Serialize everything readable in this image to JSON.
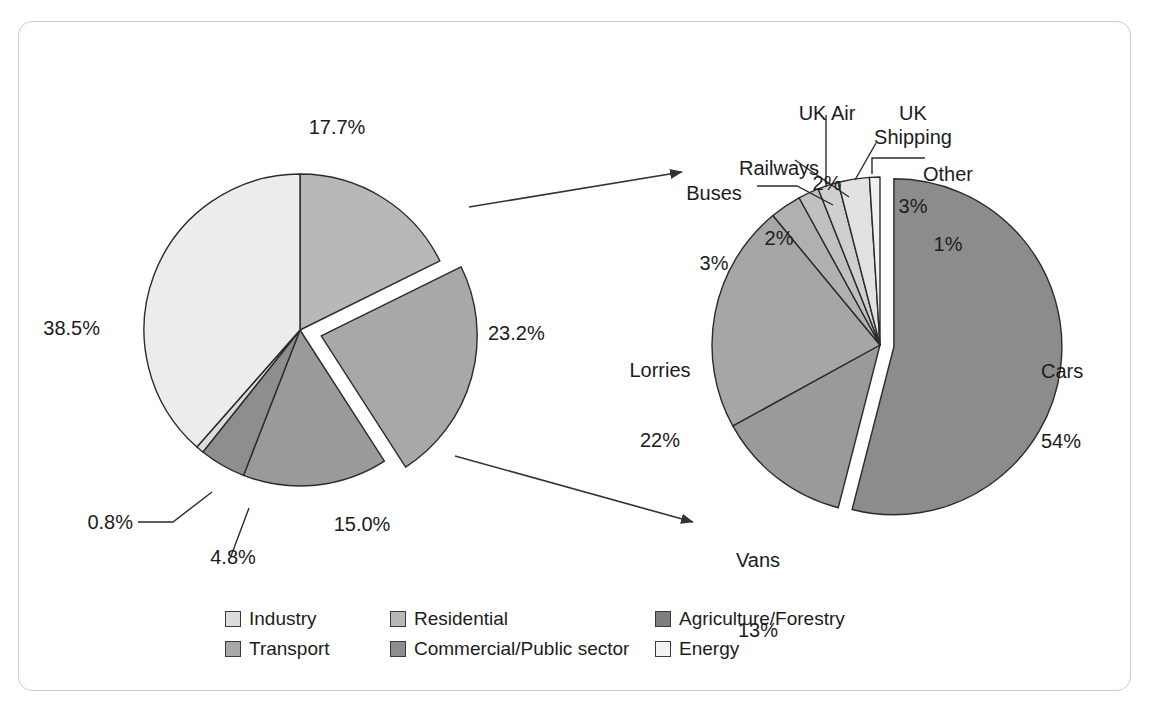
{
  "figure": {
    "width": 1153,
    "height": 713,
    "background": "#ffffff",
    "frame_color": "#cdcdcd"
  },
  "chart_data": [
    {
      "type": "pie",
      "name": "uk-co2-emissions-by-sector",
      "title": "",
      "total": 100,
      "exploded_slice": "Transport",
      "categories": [
        "Residential",
        "Transport",
        "Agriculture/Forestry",
        "Commercial/Public sector",
        "Industry",
        "Energy"
      ],
      "values": [
        17.7,
        23.2,
        15.0,
        4.8,
        0.8,
        38.5
      ],
      "labels": [
        "17.7%",
        "23.2%",
        "15.0%",
        "4.8%",
        "0.8%",
        "38.5%"
      ],
      "colors": [
        "#b8b8b8",
        "#a8a8a8",
        "#9a9a9a",
        "#8e8e8e",
        "#dcdcdc",
        "#ececec"
      ],
      "legend_position": "bottom"
    },
    {
      "type": "pie",
      "name": "transport-emissions-breakdown",
      "title": "",
      "total": 100,
      "exploded_slice": "Cars",
      "categories": [
        "Cars",
        "Vans",
        "Lorries",
        "Buses",
        "Railways",
        "UK Air",
        "UK Shipping",
        "Other"
      ],
      "values": [
        54,
        13,
        22,
        3,
        2,
        2,
        3,
        1
      ],
      "labels": [
        "54%",
        "13%",
        "22%",
        "3%",
        "2%",
        "2%",
        "3%",
        "1%"
      ],
      "colors": [
        "#8c8c8c",
        "#9a9a9a",
        "#a6a6a6",
        "#b0b0b0",
        "#c0c0c0",
        "#cfcfcf",
        "#e2e2e2",
        "#f0f0f0"
      ],
      "legend_position": "none"
    }
  ],
  "left_pie": {
    "labels": [
      {
        "id": "residential",
        "text": "17.7%"
      },
      {
        "id": "transport",
        "text": "23.2%"
      },
      {
        "id": "agriculture",
        "text": "15.0%"
      },
      {
        "id": "commercial",
        "text": "4.8%"
      },
      {
        "id": "industry",
        "text": "0.8%"
      },
      {
        "id": "energy",
        "text": "38.5%"
      }
    ]
  },
  "right_pie": {
    "labels": [
      {
        "id": "cars",
        "name": "Cars",
        "value": "54%"
      },
      {
        "id": "vans",
        "name": "Vans",
        "value": "13%"
      },
      {
        "id": "lorries",
        "name": "Lorries",
        "value": "22%"
      },
      {
        "id": "buses",
        "name": "Buses",
        "value": "3%"
      },
      {
        "id": "railways",
        "name": "Railways",
        "value": "2%"
      },
      {
        "id": "uk-air",
        "name": "UK Air",
        "value": "2%"
      },
      {
        "id": "uk-shipping",
        "name": "UK\nShipping",
        "value": "3%"
      },
      {
        "id": "other",
        "name": "Other",
        "value": "1%"
      }
    ]
  },
  "legend": {
    "rows": [
      [
        {
          "label": "Industry",
          "color": "#dcdcdc"
        },
        {
          "label": "Residential",
          "color": "#b8b8b8"
        },
        {
          "label": "Agriculture/Forestry",
          "color": "#7e7e7e"
        }
      ],
      [
        {
          "label": "Transport",
          "color": "#a8a8a8"
        },
        {
          "label": "Commercial/Public sector",
          "color": "#8e8e8e"
        },
        {
          "label": "Energy",
          "color": "#f2f2f2"
        }
      ]
    ]
  }
}
